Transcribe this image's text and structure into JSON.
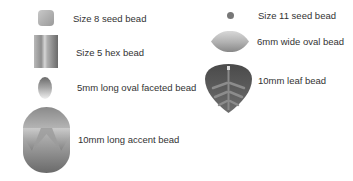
{
  "legend": {
    "items": [
      {
        "id": "size8",
        "label": "Size 8 seed bead",
        "icon": "square-seed-bead-icon"
      },
      {
        "id": "size5hex",
        "label": "Size 5 hex bead",
        "icon": "hex-bead-icon"
      },
      {
        "id": "oval5",
        "label": "5mm long oval faceted bead",
        "icon": "oval-faceted-bead-icon"
      },
      {
        "id": "accent10",
        "label": "10mm long accent bead",
        "icon": "accent-bead-icon"
      },
      {
        "id": "size11",
        "label": "Size 11 seed bead",
        "icon": "round-seed-bead-icon"
      },
      {
        "id": "oval6",
        "label": "6mm wide oval bead",
        "icon": "wide-oval-bead-icon"
      },
      {
        "id": "leaf10",
        "label": "10mm leaf bead",
        "icon": "leaf-bead-icon"
      }
    ]
  },
  "colors": {
    "text": "#333333",
    "bead_light": "#d8d8d8",
    "bead_mid": "#a0a0a0",
    "bead_dark": "#5a5a5a"
  }
}
